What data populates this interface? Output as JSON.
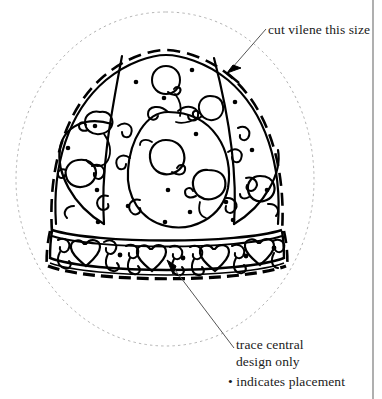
{
  "document": {
    "type": "embroidery-pattern-diagram",
    "subject": "hat",
    "background_color": "#ffffff",
    "ink_color": "#000000",
    "guide_color": "#b0b0b0",
    "width": 382,
    "height": 399
  },
  "annotations": {
    "cut_label": "cut vilene this size",
    "trace_label_line1": "trace central",
    "trace_label_line2": "design only",
    "dot_key": "• indicates placement"
  },
  "legend": {
    "dot_symbol": "•",
    "dot_meaning": "indicates placement"
  },
  "pattern": {
    "outer_guide_shape": "dotted-ellipse",
    "hat_outline_style": "dashed",
    "motifs": [
      "tulip",
      "heart",
      "scroll-swirl",
      "placement-dot"
    ],
    "band_motifs": [
      "heart",
      "scroll-swirl",
      "placement-dot"
    ],
    "crown_dot_count": 14,
    "band_dot_count": 4,
    "band_heart_count": 4
  },
  "leaders": {
    "cut_arrow_from": [
      265,
      30
    ],
    "cut_arrow_to": [
      228,
      72
    ],
    "trace_arrow_from": [
      232,
      350
    ],
    "trace_arrow_to": [
      168,
      262
    ]
  }
}
